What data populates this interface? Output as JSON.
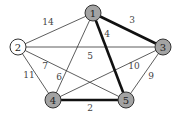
{
  "graph": {
    "colors": {
      "highlighted_node_fill": "#a3a3a3",
      "plain_node_fill": "#ffffff",
      "edge": "#333333",
      "bold_edge": "#111111"
    },
    "nodes": [
      {
        "id": "1",
        "label": "1",
        "x": 93,
        "y": 13,
        "highlighted": true
      },
      {
        "id": "2",
        "label": "2",
        "x": 18,
        "y": 47,
        "highlighted": false
      },
      {
        "id": "3",
        "label": "3",
        "x": 163,
        "y": 47,
        "highlighted": true
      },
      {
        "id": "4",
        "label": "4",
        "x": 53,
        "y": 100,
        "highlighted": true
      },
      {
        "id": "5",
        "label": "5",
        "x": 126,
        "y": 100,
        "highlighted": true
      }
    ],
    "edges": [
      {
        "from": "1",
        "to": "2",
        "weight": "14",
        "bold": false,
        "lx": 48,
        "ly": 22
      },
      {
        "from": "1",
        "to": "3",
        "weight": "3",
        "bold": true,
        "lx": 132,
        "ly": 20
      },
      {
        "from": "1",
        "to": "5",
        "weight": "4",
        "bold": true,
        "lx": 107,
        "ly": 34
      },
      {
        "from": "1",
        "to": "4",
        "weight": "6",
        "bold": false,
        "lx": 59,
        "ly": 77
      },
      {
        "from": "2",
        "to": "3",
        "weight": "5",
        "bold": false,
        "lx": 90,
        "ly": 56
      },
      {
        "from": "2",
        "to": "5",
        "weight": "7",
        "bold": false,
        "lx": 45,
        "ly": 66
      },
      {
        "from": "2",
        "to": "4",
        "weight": "11",
        "bold": false,
        "lx": 29,
        "ly": 75
      },
      {
        "from": "3",
        "to": "4",
        "weight": "10",
        "bold": false,
        "lx": 134,
        "ly": 66
      },
      {
        "from": "3",
        "to": "5",
        "weight": "9",
        "bold": false,
        "lx": 151,
        "ly": 76
      },
      {
        "from": "4",
        "to": "5",
        "weight": "2",
        "bold": true,
        "lx": 90,
        "ly": 108
      }
    ]
  }
}
